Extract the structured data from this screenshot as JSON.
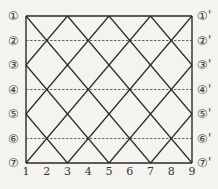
{
  "diagram": {
    "row_labels_left": [
      "①",
      "②",
      "③",
      "④",
      "⑤",
      "⑥",
      "⑦"
    ],
    "row_labels_right": [
      "①'",
      "②'",
      "③'",
      "④'",
      "⑤'",
      "⑥'",
      "⑦'"
    ],
    "column_labels": [
      "1",
      "2",
      "3",
      "4",
      "5",
      "6",
      "7",
      "8",
      "9"
    ],
    "solid_rows": [
      0,
      2,
      4,
      6
    ],
    "dashed_rows": [
      1,
      3,
      5
    ],
    "line_color": "#2a2a2a",
    "dash_color": "#555555"
  }
}
